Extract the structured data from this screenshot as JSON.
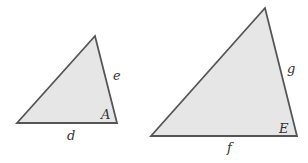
{
  "diagram": {
    "type": "similar-triangles",
    "colors": {
      "fill": "#e6e6e6",
      "stroke": "#555555",
      "label": "#333333"
    },
    "triangles": [
      {
        "id": "small",
        "vertices": [
          [
            95,
            36
          ],
          [
            17,
            123
          ],
          [
            117,
            123
          ]
        ],
        "labels": {
          "side_right": {
            "text": "e",
            "x": 113,
            "y": 80
          },
          "angle": {
            "text": "A",
            "x": 101,
            "y": 119
          },
          "side_bottom": {
            "text": "d",
            "x": 67,
            "y": 140
          }
        }
      },
      {
        "id": "large",
        "vertices": [
          [
            265,
            8
          ],
          [
            151,
            136
          ],
          [
            297,
            136
          ]
        ],
        "labels": {
          "side_right": {
            "text": "g",
            "x": 287,
            "y": 73
          },
          "angle": {
            "text": "E",
            "x": 279,
            "y": 133
          },
          "side_bottom": {
            "text": "f",
            "x": 227,
            "y": 152
          }
        }
      }
    ]
  }
}
